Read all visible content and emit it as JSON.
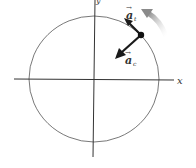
{
  "diagram": {
    "axes": {
      "x_label": "x",
      "y_label": "y"
    },
    "vectors": {
      "tangential": {
        "symbol": "a",
        "subscript": "t",
        "arrow": "→"
      },
      "centripetal": {
        "symbol": "a",
        "subscript": "c",
        "arrow": "→"
      }
    },
    "motion_direction": "counterclockwise",
    "colors": {
      "circle": "#555555",
      "axes": "#333333",
      "vectors": "#1a1a1a",
      "motion_arrow": "#9a9a9a",
      "text": "#333333"
    }
  }
}
